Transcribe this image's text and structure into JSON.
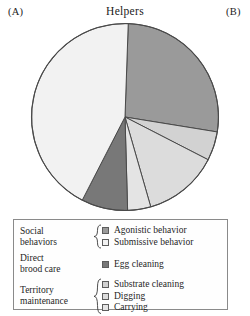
{
  "panels": {
    "left_label": "(A)",
    "right_label": "(B)"
  },
  "chart_title": "Helpers",
  "legend": {
    "groups": [
      {
        "name": "Social\nbehaviors",
        "name_line1": "Social",
        "name_line2": "behaviors",
        "has_brace": true,
        "items": [
          {
            "label": "Agonistic behavior",
            "color": "#9a9a9a"
          },
          {
            "label": "Submissive behavior",
            "color": "#f2f2f2"
          }
        ]
      },
      {
        "name_line1": "Direct",
        "name_line2": "brood care",
        "has_brace": false,
        "items": [
          {
            "label": "Egg cleaning",
            "color": "#787878"
          }
        ]
      },
      {
        "name_line1": "Territory",
        "name_line2": "maintenance",
        "has_brace": true,
        "items": [
          {
            "label": "Substrate cleaning",
            "color": "#d2d2d2"
          },
          {
            "label": "Digging",
            "color": "#dcdcdc"
          },
          {
            "label": "Carrying",
            "color": "#e4e4e4"
          }
        ]
      }
    ]
  },
  "chart_data": {
    "type": "pie",
    "title": "Helpers",
    "subtitle": "",
    "xlabel": "",
    "ylabel": "",
    "grid": false,
    "legend_position": "below",
    "units": "percent of behavioral acts",
    "start_angle_deg": -88,
    "direction": "clockwise",
    "labels": [
      "Agonistic behavior",
      "Substrate cleaning",
      "Digging",
      "Carrying",
      "Egg cleaning",
      "Submissive behavior"
    ],
    "values": [
      27,
      5,
      13,
      4,
      8,
      43
    ],
    "colors": [
      "#9a9a9a",
      "#d2d2d2",
      "#dcdcdc",
      "#e4e4e4",
      "#787878",
      "#f2f2f2"
    ],
    "slices": [
      {
        "label": "Agonistic behavior",
        "value": 27,
        "color": "#9a9a9a",
        "start_deg": -88,
        "end_deg": 9
      },
      {
        "label": "Substrate cleaning",
        "value": 5,
        "color": "#d2d2d2",
        "start_deg": 9,
        "end_deg": 27
      },
      {
        "label": "Digging",
        "value": 13,
        "color": "#dcdcdc",
        "start_deg": 27,
        "end_deg": 74
      },
      {
        "label": "Carrying",
        "value": 4,
        "color": "#e4e4e4",
        "start_deg": 74,
        "end_deg": 88
      },
      {
        "label": "Egg cleaning",
        "value": 8,
        "color": "#787878",
        "start_deg": 88,
        "end_deg": 117
      },
      {
        "label": "Submissive behavior",
        "value": 43,
        "color": "#f2f2f2",
        "start_deg": 117,
        "end_deg": 272
      }
    ]
  }
}
